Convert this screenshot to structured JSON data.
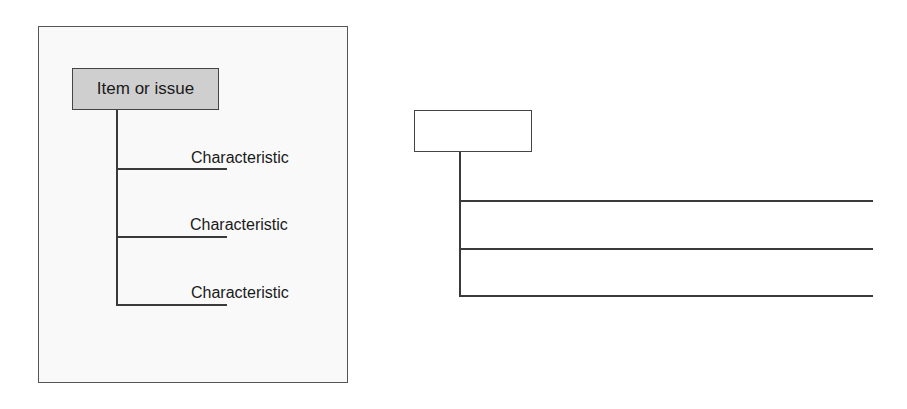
{
  "example_diagram": {
    "root_label": "Item or issue",
    "root_fill": "#cfcfcf",
    "panel_fill": "#f9f9f9",
    "characteristics": [
      {
        "label": "Characteristic"
      },
      {
        "label": "Characteristic"
      },
      {
        "label": "Characteristic"
      }
    ]
  },
  "blank_template": {
    "root_label": "",
    "lines": 3
  }
}
